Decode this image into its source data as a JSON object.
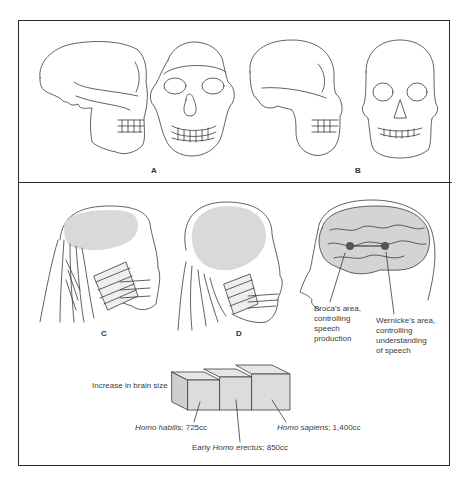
{
  "figure": {
    "top_panel": {
      "labels": {
        "a": "A",
        "b": "B"
      }
    },
    "bottom_panel": {
      "labels": {
        "c": "C",
        "d": "D"
      },
      "brain": {
        "broca": [
          "Broca's area,",
          "controlling",
          "speech",
          "production"
        ],
        "wernicke": [
          "Wernicke's area,",
          "controlling",
          "understanding",
          "of speech"
        ]
      },
      "brain_size": {
        "title": "Increase in brain size",
        "habilis": {
          "species": "Homo habilis",
          "volume": "; 725cc"
        },
        "erectus": {
          "prefix": "Early ",
          "species": "Homo erectus",
          "volume": "; 850cc"
        },
        "sapiens": {
          "species": "Homo sapiens",
          "volume": "; 1,400cc"
        }
      }
    }
  },
  "colors": {
    "line": "#2b2b2b",
    "brain_fill": "#d9d9d9",
    "box_fill": "#dcdcdc"
  }
}
